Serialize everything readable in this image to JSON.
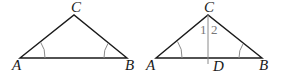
{
  "figures": [
    {
      "id": "left",
      "vertices": {
        "A": {
          "label": "A",
          "x": 20,
          "y": 58
        },
        "B": {
          "label": "B",
          "x": 127,
          "y": 58
        },
        "C": {
          "label": "C",
          "x": 74,
          "y": 15
        }
      },
      "angle_marks": [
        "A",
        "B"
      ]
    },
    {
      "id": "right",
      "vertices": {
        "A": {
          "label": "A",
          "x": 156,
          "y": 58
        },
        "B": {
          "label": "B",
          "x": 262,
          "y": 58
        },
        "C": {
          "label": "C",
          "x": 208,
          "y": 15
        },
        "D": {
          "label": "D",
          "x": 208,
          "y": 58
        }
      },
      "segment": "CD",
      "angle_labels": [
        "1",
        "2"
      ],
      "angle_marks": [
        "A",
        "B"
      ]
    }
  ],
  "colors": {
    "line": "#1a1a1a",
    "aux_line": "#8a8a8a",
    "arc": "#8a8a8a"
  }
}
